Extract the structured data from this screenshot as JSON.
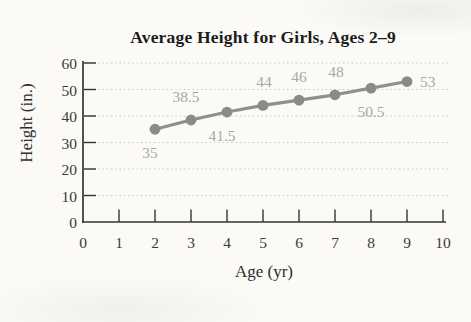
{
  "chart_data": {
    "type": "line",
    "title": "Average Height for Girls, Ages 2–9",
    "xlabel": "Age (yr)",
    "ylabel": "Height (in.)",
    "xlim": [
      0,
      10
    ],
    "ylim": [
      0,
      60
    ],
    "xticks": [
      0,
      1,
      2,
      3,
      4,
      5,
      6,
      7,
      8,
      9,
      10
    ],
    "yticks": [
      0,
      10,
      20,
      30,
      40,
      50,
      60
    ],
    "grid": "horizontal-dotted",
    "legend": "none",
    "series_name": "Average height",
    "x": [
      2,
      3,
      4,
      5,
      6,
      7,
      8,
      9
    ],
    "y": [
      35,
      38.5,
      41.5,
      44,
      46,
      48,
      50.5,
      53
    ],
    "points": [
      {
        "age": 2,
        "height": 35,
        "label": "35",
        "label_pos": "below",
        "label_dx": -5
      },
      {
        "age": 3,
        "height": 38.5,
        "label": "38.5",
        "label_pos": "above",
        "label_dx": -5
      },
      {
        "age": 4,
        "height": 41.5,
        "label": "41.5",
        "label_pos": "below",
        "label_dx": -5
      },
      {
        "age": 5,
        "height": 44,
        "label": "44",
        "label_pos": "above",
        "label_dx": 1
      },
      {
        "age": 6,
        "height": 46,
        "label": "46",
        "label_pos": "above",
        "label_dx": 0
      },
      {
        "age": 7,
        "height": 48,
        "label": "48",
        "label_pos": "above",
        "label_dx": 1
      },
      {
        "age": 8,
        "height": 50.5,
        "label": "50.5",
        "label_pos": "below",
        "label_dx": 0
      },
      {
        "age": 9,
        "height": 53,
        "label": "53",
        "label_pos": "right",
        "label_dx": 0
      }
    ],
    "style": {
      "line_color": "#8f8f8f",
      "marker_color": "#8a8a8a",
      "data_label_color": "#a8a8a8",
      "grid_color": "#c9c9c9",
      "axis_color": "#333333",
      "title_color": "#1c1c1c"
    }
  }
}
